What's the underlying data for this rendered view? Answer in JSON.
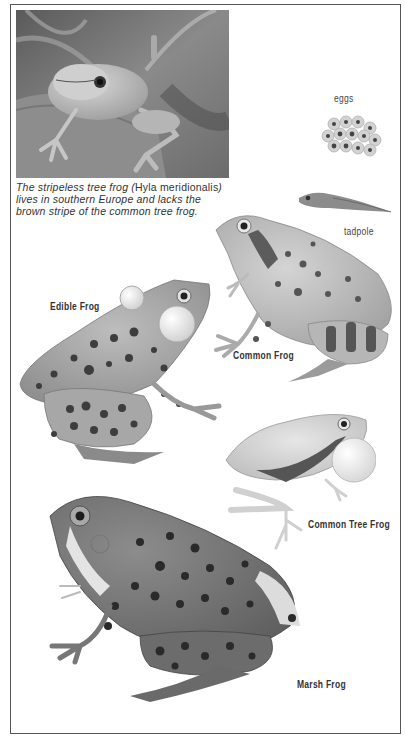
{
  "page": {
    "photo": {
      "subject": "stripeless tree frog on leaf",
      "alt": "Photograph of a stripeless tree frog"
    },
    "caption": {
      "part1": "The stripeless tree frog (",
      "species": "Hyla meridionalis",
      "part2": ") lives in southern Europe and lacks the brown stripe of the common tree frog."
    },
    "illustrations": [
      {
        "id": "eggs",
        "label": "eggs"
      },
      {
        "id": "tadpole",
        "label": "tadpole"
      },
      {
        "id": "common-frog",
        "label": "Common Frog"
      },
      {
        "id": "edible-frog",
        "label": "Edible Frog"
      },
      {
        "id": "common-tree-frog",
        "label": "Common Tree Frog"
      },
      {
        "id": "marsh-frog",
        "label": "Marsh Frog"
      }
    ]
  },
  "colors": {
    "border": "#555555",
    "text": "#333333",
    "background": "#ffffff"
  }
}
